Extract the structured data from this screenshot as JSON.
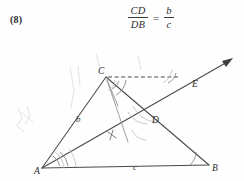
{
  "page": {
    "background_color": "#fefefe",
    "ink_color": "#4a4a4a",
    "width": 244,
    "height": 181
  },
  "equation": {
    "item_number": "(8)",
    "numerator_left": "CD",
    "denominator_left": "DB",
    "equals": "=",
    "numerator_right": "b",
    "denominator_right": "c"
  },
  "diagram": {
    "type": "euclidean-geometry-figure",
    "vertices": [
      {
        "label": "A",
        "x": 42,
        "y": 168
      },
      {
        "label": "B",
        "x": 209,
        "y": 165
      },
      {
        "label": "C",
        "x": 106,
        "y": 77
      },
      {
        "label": "D",
        "x": 149,
        "y": 120
      },
      {
        "label": "E",
        "x": 196,
        "y": 83
      }
    ],
    "side_labels": [
      {
        "label": "b",
        "x": 81,
        "y": 120,
        "on_segment": "AC"
      },
      {
        "label": "c",
        "x": 136,
        "y": 166,
        "on_segment": "AB"
      }
    ],
    "segments": [
      {
        "name": "AB",
        "from": "A",
        "to": "B",
        "style": "solid"
      },
      {
        "name": "AC",
        "from": "A",
        "to": "C",
        "style": "solid"
      },
      {
        "name": "CB",
        "from": "C",
        "to": "B",
        "style": "solid"
      },
      {
        "name": "AE-ray",
        "from": "A",
        "to": "arrow-tip",
        "style": "solid-with-arrow"
      },
      {
        "name": "C-parallel-dashed",
        "from": "C",
        "to": "ray-crossing",
        "style": "dashed"
      },
      {
        "name": "C-to-D-helper",
        "from": "C",
        "to": "D",
        "style": "thin"
      }
    ],
    "arrow_tip": {
      "x": 233,
      "y": 58
    },
    "angle_marks": [
      {
        "at": "A",
        "count": 2,
        "note": "bisected angle"
      },
      {
        "at": "B",
        "count": 1
      },
      {
        "at": "C",
        "count": 2
      },
      {
        "at": "D",
        "count": 2
      }
    ],
    "tick_marks": [
      {
        "on_segment": "AD",
        "x": 112,
        "y": 136
      }
    ]
  }
}
